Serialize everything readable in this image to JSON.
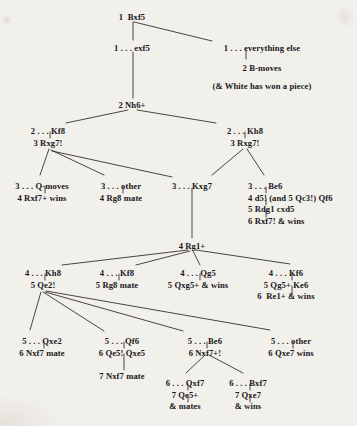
{
  "diagram": {
    "type": "chess-analysis-tree",
    "background_color": "#f2f0eb",
    "text_color": "#19161a",
    "line_color": "#2a2529",
    "nodes": [
      {
        "id": "n1",
        "x": 132,
        "y": 12,
        "align": "center",
        "lines": [
          "1  Bxf5"
        ]
      },
      {
        "id": "n2",
        "x": 132,
        "y": 43,
        "align": "center",
        "lines": [
          "1 . . . exf5"
        ]
      },
      {
        "id": "n3",
        "x": 262,
        "y": 43,
        "align": "center",
        "lines": [
          "1 . . . everything else"
        ]
      },
      {
        "id": "n4",
        "x": 262,
        "y": 63,
        "align": "center",
        "lines": [
          "2 B-moves"
        ]
      },
      {
        "id": "n5",
        "x": 262,
        "y": 81,
        "align": "center",
        "lines": [
          "(& White has won a piece)"
        ]
      },
      {
        "id": "n6",
        "x": 132,
        "y": 100,
        "align": "center",
        "lines": [
          "2 Nh6+"
        ]
      },
      {
        "id": "n7",
        "x": 48,
        "y": 126,
        "align": "center",
        "lines": [
          "2 . . . Kf8",
          "3 Rxg7!"
        ]
      },
      {
        "id": "n8",
        "x": 245,
        "y": 126,
        "align": "center",
        "lines": [
          "2 . . . Kh8",
          "3 Rxg7!"
        ]
      },
      {
        "id": "n9",
        "x": 42,
        "y": 181,
        "align": "center",
        "lines": [
          "3 . . . Q-moves",
          "4 Rxf7+ wins"
        ]
      },
      {
        "id": "n10",
        "x": 121,
        "y": 181,
        "align": "center",
        "lines": [
          "3 . . . other",
          "4 Rg8 mate"
        ]
      },
      {
        "id": "n11",
        "x": 192,
        "y": 181,
        "align": "center",
        "lines": [
          "3 . . . Kxg7"
        ]
      },
      {
        "id": "n12",
        "x": 248,
        "y": 181,
        "align": "left",
        "lines": [
          "3 . . . Be6",
          "4 d5! (and 5 Qc3!) Qf6",
          "5 Rdg1 cxd5",
          "6 Rxf7! & wins"
        ]
      },
      {
        "id": "n13",
        "x": 192,
        "y": 241,
        "align": "center",
        "lines": [
          "4 Rg1+"
        ]
      },
      {
        "id": "n14",
        "x": 43,
        "y": 268,
        "align": "center",
        "lines": [
          "4 . . . Kh8",
          "5 Qe2!"
        ]
      },
      {
        "id": "n15",
        "x": 117,
        "y": 268,
        "align": "center",
        "lines": [
          "4 . . . Kf8",
          "5 Rg8 mate"
        ]
      },
      {
        "id": "n16",
        "x": 198,
        "y": 268,
        "align": "center",
        "lines": [
          "4 . . . Qg5",
          "5 Qxg5+ & wins"
        ]
      },
      {
        "id": "n17",
        "x": 286,
        "y": 268,
        "align": "center",
        "lines": [
          "4 . . . Kf6",
          "5 Qg5+ Ke6",
          "6  Re1+ & wins"
        ]
      },
      {
        "id": "n18",
        "x": 42,
        "y": 336,
        "align": "center",
        "lines": [
          "5 . . . Qxe2",
          "6 Nxf7 mate"
        ]
      },
      {
        "id": "n19",
        "x": 122,
        "y": 336,
        "align": "center",
        "lines": [
          "5 . . . Qf6",
          "6 Qe5! Qxe5",
          "",
          "7 Nxf7 mate"
        ]
      },
      {
        "id": "n20",
        "x": 205,
        "y": 336,
        "align": "center",
        "lines": [
          "5 . . . Be6",
          "6 Nxf7+!"
        ]
      },
      {
        "id": "n21",
        "x": 291,
        "y": 336,
        "align": "center",
        "lines": [
          "5 . . . other",
          "6 Qxe7 wins"
        ]
      },
      {
        "id": "n22",
        "x": 185,
        "y": 378,
        "align": "center",
        "lines": [
          "6 . . . Qxf7",
          "7 Qe5+",
          "& mates"
        ]
      },
      {
        "id": "n23",
        "x": 248,
        "y": 378,
        "align": "center",
        "lines": [
          "6 . . . Bxf7",
          "7 Qxe7",
          "& wins"
        ]
      }
    ],
    "edges": [
      {
        "from": "1 Bxf5",
        "to": "1 ... exf5",
        "x1": 133,
        "y1": 22,
        "x2": 133,
        "y2": 40
      },
      {
        "from": "1 Bxf5",
        "to": "1 ... everything else",
        "x1": 134,
        "y1": 22,
        "x2": 212,
        "y2": 41
      },
      {
        "from": "1 ... everything else",
        "to": "2 B-moves",
        "x1": 246,
        "y1": 50,
        "x2": 246,
        "y2": 59
      },
      {
        "from": "1 ... exf5",
        "to": "2 Nh6+",
        "x1": 133,
        "y1": 52,
        "x2": 133,
        "y2": 98
      },
      {
        "from": "2 Nh6+",
        "to": "2 ... Kf8",
        "x1": 128,
        "y1": 110,
        "x2": 66,
        "y2": 123
      },
      {
        "from": "2 Nh6+",
        "to": "2 ... Kh8",
        "x1": 137,
        "y1": 110,
        "x2": 216,
        "y2": 123
      },
      {
        "from": "2 ... Kf8",
        "to": "3 Rxg7!",
        "x1": 50,
        "y1": 132,
        "x2": 50,
        "y2": 138
      },
      {
        "from": "2 ... Kh8",
        "to": "3 Rxg7!",
        "x1": 245,
        "y1": 132,
        "x2": 245,
        "y2": 138
      },
      {
        "from": "3 Rxg7! (Kf8)",
        "to": "3 ... Q-moves",
        "x1": 49,
        "y1": 149,
        "x2": 40,
        "y2": 175
      },
      {
        "from": "3 Rxg7! (Kf8)",
        "to": "3 ... other",
        "x1": 51,
        "y1": 150,
        "x2": 104,
        "y2": 175
      },
      {
        "from": "3 Rxg7! (Kf8)",
        "to": "3 ... Kxg7",
        "x1": 52,
        "y1": 151,
        "x2": 172,
        "y2": 177
      },
      {
        "from": "3 ... Q-moves",
        "to": "4 Rxf7+ wins",
        "x1": 45,
        "y1": 187,
        "x2": 45,
        "y2": 193
      },
      {
        "from": "3 ... other",
        "to": "4 Rg8 mate",
        "x1": 123,
        "y1": 187,
        "x2": 123,
        "y2": 193
      },
      {
        "from": "3 Rxg7! (Kh8)",
        "to": "3 ... Kxg7",
        "x1": 243,
        "y1": 149,
        "x2": 212,
        "y2": 175
      },
      {
        "from": "3 Rxg7! (Kh8)",
        "to": "3 ... Be6",
        "x1": 247,
        "y1": 149,
        "x2": 264,
        "y2": 175
      },
      {
        "from": "3 ... Be6",
        "to": "4 d5!",
        "x1": 266,
        "y1": 187,
        "x2": 266,
        "y2": 193
      },
      {
        "from": "4 d5!",
        "to": "5 Rdg1",
        "x1": 266,
        "y1": 198,
        "x2": 266,
        "y2": 205
      },
      {
        "from": "5 Rdg1",
        "to": "6 Rxf7!",
        "x1": 266,
        "y1": 210,
        "x2": 266,
        "y2": 217
      },
      {
        "from": "3 ... Kxg7",
        "to": "4 Rg1+",
        "x1": 192,
        "y1": 188,
        "x2": 192,
        "y2": 238
      },
      {
        "from": "4 Rg1+",
        "to": "4 ... Kh8",
        "x1": 188,
        "y1": 250,
        "x2": 62,
        "y2": 265
      },
      {
        "from": "4 Rg1+",
        "to": "4 ... Kf8",
        "x1": 190,
        "y1": 251,
        "x2": 136,
        "y2": 265
      },
      {
        "from": "4 Rg1+",
        "to": "4 ... Qg5",
        "x1": 193,
        "y1": 251,
        "x2": 200,
        "y2": 265
      },
      {
        "from": "4 Rg1+",
        "to": "4 ... Kf6",
        "x1": 196,
        "y1": 250,
        "x2": 290,
        "y2": 264
      },
      {
        "from": "4 ... Kh8",
        "to": "5 Qe2!",
        "x1": 45,
        "y1": 274,
        "x2": 45,
        "y2": 280
      },
      {
        "from": "4 ... Kf8",
        "to": "5 Rg8 mate",
        "x1": 119,
        "y1": 274,
        "x2": 119,
        "y2": 280
      },
      {
        "from": "4 ... Qg5",
        "to": "5 Qxg5+ & wins",
        "x1": 200,
        "y1": 274,
        "x2": 200,
        "y2": 280
      },
      {
        "from": "4 ... Kf6",
        "to": "5 Qg5+ Ke6",
        "x1": 292,
        "y1": 274,
        "x2": 292,
        "y2": 280
      },
      {
        "from": "5 Qg5+ Ke6",
        "to": "6 Re1+ & wins",
        "x1": 292,
        "y1": 286,
        "x2": 292,
        "y2": 294
      },
      {
        "from": "5 Qe2!",
        "to": "5 ... Qxe2",
        "x1": 41,
        "y1": 292,
        "x2": 30,
        "y2": 330
      },
      {
        "from": "5 Qe2!",
        "to": "5 ... Qf6",
        "x1": 43,
        "y1": 292,
        "x2": 104,
        "y2": 331
      },
      {
        "from": "5 Qe2!",
        "to": "5 ... Be6",
        "x1": 45,
        "y1": 292,
        "x2": 183,
        "y2": 331
      },
      {
        "from": "5 Qe2!",
        "to": "5 ... other",
        "x1": 46,
        "y1": 291,
        "x2": 270,
        "y2": 330
      },
      {
        "from": "5 ... Qxe2",
        "to": "6 Nxf7 mate",
        "x1": 44,
        "y1": 342,
        "x2": 44,
        "y2": 348
      },
      {
        "from": "5 ... Qf6",
        "to": "6 Qe5! Qxe5",
        "x1": 124,
        "y1": 342,
        "x2": 124,
        "y2": 348
      },
      {
        "from": "6 Qe5! Qxe5",
        "to": "7 Nxf7 mate",
        "x1": 124,
        "y1": 354,
        "x2": 124,
        "y2": 370
      },
      {
        "from": "5 ... Be6",
        "to": "6 Nxf7+!",
        "x1": 207,
        "y1": 342,
        "x2": 207,
        "y2": 348
      },
      {
        "from": "5 ... other",
        "to": "6 Qxe7 wins",
        "x1": 293,
        "y1": 342,
        "x2": 293,
        "y2": 348
      },
      {
        "from": "6 Nxf7+!",
        "to": "6 ... Qxf7",
        "x1": 205,
        "y1": 355,
        "x2": 186,
        "y2": 373
      },
      {
        "from": "6 Nxf7+!",
        "to": "6 ... Bxf7",
        "x1": 209,
        "y1": 355,
        "x2": 243,
        "y2": 373
      },
      {
        "from": "6 ... Qxf7",
        "to": "7 Qe5+",
        "x1": 188,
        "y1": 384,
        "x2": 188,
        "y2": 390
      },
      {
        "from": "7 Qe5+",
        "to": "& mates",
        "x1": 188,
        "y1": 396,
        "x2": 188,
        "y2": 402
      },
      {
        "from": "6 ... Bxf7",
        "to": "7 Qxe7",
        "x1": 250,
        "y1": 384,
        "x2": 250,
        "y2": 390
      },
      {
        "from": "7 Qxe7",
        "to": "& wins",
        "x1": 250,
        "y1": 396,
        "x2": 250,
        "y2": 402
      }
    ]
  }
}
